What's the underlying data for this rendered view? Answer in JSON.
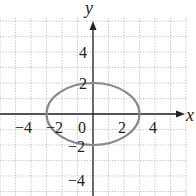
{
  "chart_data": {
    "type": "line",
    "title": "",
    "xlabel": "x",
    "ylabel": "y",
    "xlim": [
      -6,
      6
    ],
    "ylim": [
      -5.5,
      6
    ],
    "grid": true,
    "grid_step": 1,
    "x_ticks": [
      -4,
      -2,
      0,
      2,
      4
    ],
    "y_ticks": [
      -4,
      -2,
      2,
      4
    ],
    "x_tick_labels": [
      "−4",
      "−2",
      "0",
      "2",
      "4"
    ],
    "y_tick_labels": [
      "−4",
      "−2",
      "2",
      "4"
    ],
    "series": [
      {
        "name": "ellipse",
        "equation": "x^2/9 + y^2/4 = 1",
        "center": [
          0,
          0
        ],
        "semi_axis_x": 3,
        "semi_axis_y": 2,
        "color": "#888888"
      }
    ]
  },
  "labels": {
    "x_axis": "x",
    "y_axis": "y",
    "x_tick_neg4": "−4",
    "x_tick_neg2": "−2",
    "origin": "0",
    "x_tick_2": "2",
    "x_tick_4": "4",
    "y_tick_4": "4",
    "y_tick_2": "2",
    "y_tick_neg2": "−2",
    "y_tick_neg4": "−4"
  },
  "colors": {
    "grid": "#b0b0b0",
    "axis": "#222222",
    "curve": "#8a8a8a"
  }
}
